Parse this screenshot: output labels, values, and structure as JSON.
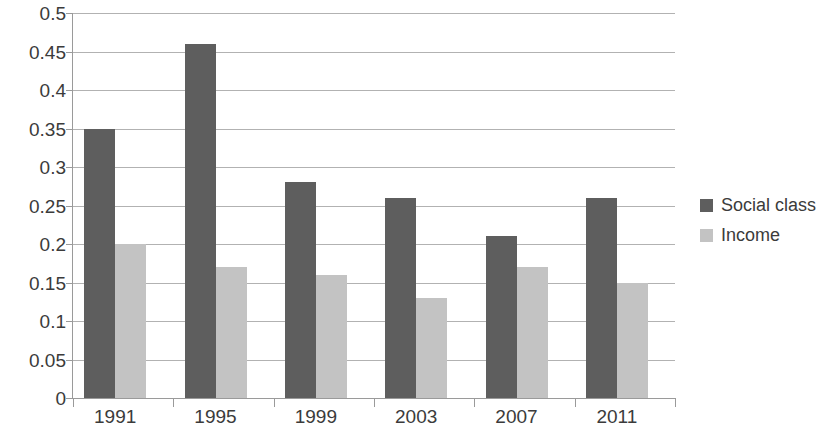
{
  "chart_data": {
    "type": "bar",
    "title": "",
    "subtitle": "",
    "xlabel": "",
    "ylabel": "",
    "categories": [
      "1991",
      "1995",
      "1999",
      "2003",
      "2007",
      "2011"
    ],
    "series": [
      {
        "name": "Social class",
        "color": "#5e5e5e",
        "values": [
          0.35,
          0.46,
          0.28,
          0.26,
          0.21,
          0.26
        ]
      },
      {
        "name": "Income",
        "color": "#c3c3c3",
        "values": [
          0.2,
          0.17,
          0.16,
          0.13,
          0.17,
          0.15
        ]
      }
    ],
    "ylim": [
      0,
      0.5
    ],
    "ytick_values": [
      0,
      0.05,
      0.1,
      0.15,
      0.2,
      0.25,
      0.3,
      0.35,
      0.4,
      0.45,
      0.5
    ],
    "ytick_labels": [
      "0",
      "0.05",
      "0.1",
      "0.15",
      "0.2",
      "0.25",
      "0.3",
      "0.35",
      "0.4",
      "0.45",
      "0.5"
    ],
    "grid": true,
    "grid_axis": "y",
    "legend_position": "right",
    "background_color": "#ffffff",
    "grid_color": "#b2b2b2",
    "axis_color": "#9a9a9a",
    "text_color": "#3b3b3b"
  }
}
